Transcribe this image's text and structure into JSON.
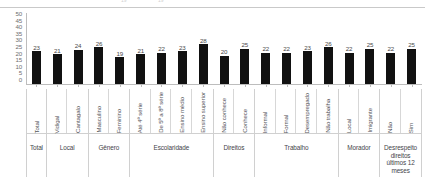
{
  "top_strip": {
    "ghost_left": "19",
    "ghost_right": "19"
  },
  "chart_data": {
    "type": "bar",
    "title": "",
    "subtitle": "",
    "xlabel": "",
    "ylabel": "",
    "ylim": [
      0,
      50
    ],
    "ytick_step": 5,
    "yticks": [
      "50",
      "45",
      "40",
      "35",
      "30",
      "25",
      "20",
      "15",
      "10",
      "5",
      "0"
    ],
    "grid": false,
    "legend": "none",
    "bar_color": "#111111",
    "categories": [
      "Total",
      "Vidigal",
      "Cantagalo",
      "Masculino",
      "Feminino",
      "Até 4ª série",
      "De 5ª a 8ª série",
      "Ensino médio",
      "Ensino superior",
      "Não conhece",
      "Conhece",
      "Informal",
      "Formal",
      "Desempregado",
      "Não trabalha",
      "Local",
      "Imigrante",
      "Não",
      "Sim"
    ],
    "values": [
      23,
      21,
      24,
      26,
      19,
      21,
      22,
      23,
      28,
      20,
      25,
      22,
      22,
      23,
      26,
      22,
      25,
      22,
      25
    ],
    "groups": [
      {
        "title": "Total",
        "categories": [
          "Total"
        ],
        "values": [
          23
        ]
      },
      {
        "title": "Local",
        "categories": [
          "Vidigal",
          "Cantagalo"
        ],
        "values": [
          21,
          24
        ]
      },
      {
        "title": "Gênero",
        "categories": [
          "Masculino",
          "Feminino"
        ],
        "values": [
          26,
          19
        ]
      },
      {
        "title": "Escolaridade",
        "categories": [
          "Até 4ª série",
          "De 5ª a 8ª série",
          "Ensino médio",
          "Ensino superior"
        ],
        "values": [
          21,
          22,
          23,
          28
        ]
      },
      {
        "title": "Direitos",
        "categories": [
          "Não conhece",
          "Conhece"
        ],
        "values": [
          20,
          25
        ]
      },
      {
        "title": "Trabalho",
        "categories": [
          "Informal",
          "Formal",
          "Desempregado",
          "Não trabalha"
        ],
        "values": [
          22,
          22,
          23,
          26
        ]
      },
      {
        "title": "Morador",
        "categories": [
          "Local",
          "Imigrante"
        ],
        "values": [
          22,
          25
        ]
      },
      {
        "title": "Desrespeito direitos últimos 12 meses",
        "categories": [
          "Não",
          "Sim"
        ],
        "values": [
          22,
          25
        ]
      }
    ]
  }
}
